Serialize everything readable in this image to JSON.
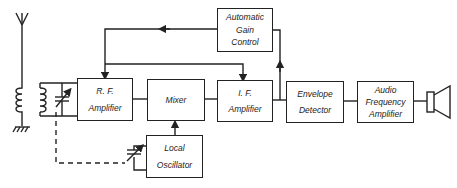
{
  "diagram": {
    "blocks": {
      "rf": {
        "lines": [
          "R. F.",
          "Amplifier"
        ]
      },
      "mixer": {
        "lines": [
          "Mixer"
        ]
      },
      "if": {
        "lines": [
          "I. F.",
          "Amplifier"
        ]
      },
      "agc": {
        "lines": [
          "Automatic",
          "Gain",
          "Control"
        ]
      },
      "envelope": {
        "lines": [
          "Envelope",
          "Detector"
        ]
      },
      "audio": {
        "lines": [
          "Audio",
          "Frequency",
          "Amplifier"
        ]
      },
      "lo": {
        "lines": [
          "Local",
          "Oscillator"
        ]
      }
    },
    "symbols": [
      "antenna-icon",
      "transformer-icon",
      "variable-capacitor-icon",
      "ground-icon",
      "speaker-icon"
    ],
    "line_color": "#222222"
  }
}
